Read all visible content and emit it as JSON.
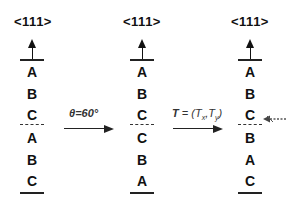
{
  "columns": [
    {
      "direction": "<111>",
      "layers_top": [
        "A",
        "B",
        "C"
      ],
      "layers_bottom": [
        "A",
        "B",
        "C"
      ]
    },
    {
      "direction": "<111>",
      "layers_top": [
        "A",
        "B",
        "C"
      ],
      "layers_bottom": [
        "C",
        "B",
        "A"
      ]
    },
    {
      "direction": "<111>",
      "layers_top": [
        "A",
        "B",
        "C"
      ],
      "layers_bottom": [
        "B",
        "A",
        "C"
      ]
    }
  ],
  "transforms": [
    {
      "label": "θ=60°"
    },
    {
      "label": "T = (Tx,Ty)",
      "T": "T",
      "eq": " = (",
      "Tx": "T",
      "x": "x",
      "sep": ",",
      "Ty": "T",
      "y": "y",
      "close": ")"
    }
  ],
  "interface_marker": {
    "icon": "dashed-left-arrow"
  }
}
